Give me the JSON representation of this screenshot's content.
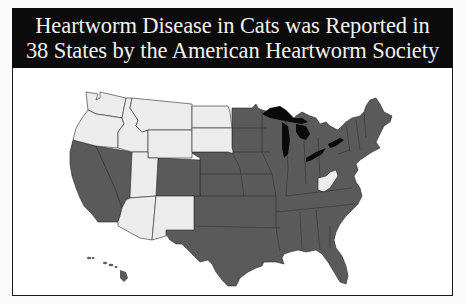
{
  "title": {
    "line1": "Heartworm Disease in Cats was Reported in",
    "line2": "38 States by the American Heartworm Society"
  },
  "colors": {
    "header_bg": "#0b0b0b",
    "header_text": "#f2f2f2",
    "reported": "#5a5a5a",
    "not_reported": "#ececec",
    "lakes": "#0a0a0a"
  },
  "map": {
    "states_reported_count": 38,
    "legend": [
      {
        "label": "Reported",
        "color": "#5a5a5a"
      },
      {
        "label": "Not reported",
        "color": "#ececec"
      }
    ],
    "not_reported_states_visible": [
      "WA",
      "OR",
      "ID",
      "MT",
      "WY",
      "ND",
      "SD",
      "UT",
      "AZ",
      "NM",
      "WV"
    ],
    "reported_regions_visible": [
      "CA",
      "NV",
      "CO",
      "TX",
      "Midwest",
      "South",
      "Northeast",
      "Florida",
      "HI"
    ]
  }
}
